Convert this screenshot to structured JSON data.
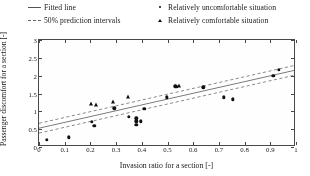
{
  "legend": {
    "items": [
      {
        "label": "Fitted line",
        "marker": "solid-line-swatch"
      },
      {
        "label": "Relatively uncomfortable situation",
        "marker": "filled-circle-marker"
      },
      {
        "label": "50% prediction intervals",
        "marker": "dashed-line-swatch"
      },
      {
        "label": "Relatively comfortable situation",
        "marker": "filled-triangle-marker"
      }
    ]
  },
  "axes": {
    "x_title": "Invasion ratio for a section [-]",
    "y_title": "Passenger discomfort for a section [-]",
    "x_ticks": [
      "0",
      "0.1",
      "0.2",
      "0.3",
      "0.4",
      "0.5",
      "0.6",
      "0.7",
      "0.8",
      "0.9",
      "1"
    ],
    "y_ticks": [
      "0",
      "0.5",
      "1",
      "1.5",
      "2",
      "2.5",
      "3"
    ]
  },
  "chart_data": {
    "type": "scatter",
    "title": "",
    "xlabel": "Invasion ratio for a section [-]",
    "ylabel": "Passenger discomfort for a section [-]",
    "xlim": [
      0,
      1
    ],
    "ylim": [
      0,
      3
    ],
    "xticks": [
      0,
      0.1,
      0.2,
      0.3,
      0.4,
      0.5,
      0.6,
      0.7,
      0.8,
      0.9,
      1
    ],
    "yticks": [
      0,
      0.5,
      1,
      1.5,
      2,
      2.5,
      3
    ],
    "grid": false,
    "legend_position": "above-axes",
    "series": [
      {
        "name": "Relatively uncomfortable situation",
        "marker": "filled-circle",
        "points": [
          [
            0.03,
            0.2
          ],
          [
            0.115,
            0.27
          ],
          [
            0.205,
            0.7
          ],
          [
            0.215,
            0.59
          ],
          [
            0.293,
            1.09
          ],
          [
            0.35,
            0.85
          ],
          [
            0.378,
            0.8
          ],
          [
            0.378,
            0.72
          ],
          [
            0.378,
            0.63
          ],
          [
            0.396,
            0.72
          ],
          [
            0.41,
            1.07
          ],
          [
            0.497,
            1.39
          ],
          [
            0.53,
            1.7
          ],
          [
            0.537,
            1.69
          ],
          [
            0.64,
            1.67
          ],
          [
            0.718,
            1.39
          ],
          [
            0.755,
            1.34
          ],
          [
            0.912,
            2.0
          ],
          [
            0.932,
            2.16
          ]
        ]
      },
      {
        "name": "Relatively comfortable situation",
        "marker": "filled-triangle",
        "points": [
          [
            0.203,
            1.21
          ],
          [
            0.222,
            1.17
          ],
          [
            0.287,
            1.25
          ],
          [
            0.348,
            1.39
          ],
          [
            0.543,
            1.7
          ]
        ]
      }
    ],
    "fitted_line": {
      "name": "Fitted line",
      "style": "solid",
      "x": [
        0,
        1
      ],
      "y": [
        0.48,
        2.13
      ],
      "slope": 1.65,
      "intercept": 0.48
    },
    "prediction_intervals": {
      "name": "50% prediction intervals",
      "style": "dashed",
      "upper": {
        "x": [
          0,
          1
        ],
        "y": [
          0.62,
          2.27
        ]
      },
      "lower": {
        "x": [
          0,
          1
        ],
        "y": [
          0.34,
          1.99
        ]
      }
    }
  }
}
